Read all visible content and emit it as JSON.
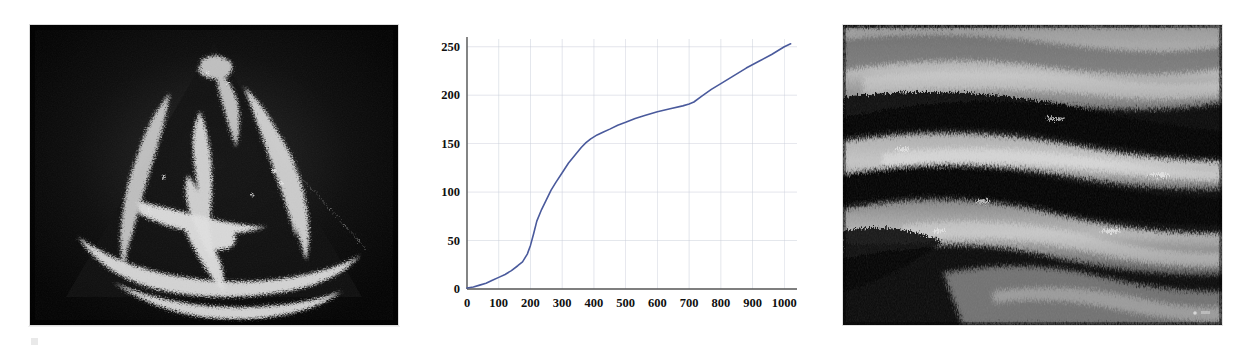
{
  "figure": {
    "background_color": "#ffffff",
    "panels": [
      {
        "id": "cardiac-echocardiogram",
        "kind": "ultrasound-image",
        "modality_label": "echocardiogram",
        "view_label": "apical four-chamber view",
        "background_color": "#050505",
        "tissue_color": "#d8d8d8"
      },
      {
        "id": "cumulative-curve-chart",
        "kind": "line-chart"
      },
      {
        "id": "vascular-ultrasound",
        "kind": "ultrasound-image",
        "modality_label": "B-mode vascular ultrasound",
        "view_label": "longitudinal vessel wall view",
        "background_color": "#0a0a0a",
        "tissue_color": "#c9c9c9"
      }
    ]
  },
  "chart_data": {
    "type": "line",
    "title": "",
    "subtitle": "",
    "xlabel": "",
    "ylabel": "",
    "xlim": [
      0,
      1040
    ],
    "ylim": [
      0,
      258
    ],
    "grid": true,
    "grid_color": "#c8ccd8",
    "axis_color": "#555555",
    "legend": false,
    "legend_position": "none",
    "line_color": "#4a5a9c",
    "line_width": 1.6,
    "xticks": [
      0,
      100,
      200,
      300,
      400,
      500,
      600,
      700,
      800,
      900,
      1000
    ],
    "xtick_labels": [
      "0",
      "100",
      "200",
      "300",
      "400",
      "500",
      "600",
      "700",
      "800",
      "900",
      "1000"
    ],
    "yticks": [
      0,
      50,
      100,
      150,
      200,
      250
    ],
    "ytick_labels": [
      "0",
      "50",
      "100",
      "150",
      "200",
      "250"
    ],
    "series": [
      {
        "name": "cumulative curve",
        "x": [
          0,
          20,
          40,
          60,
          80,
          100,
          120,
          140,
          160,
          175,
          190,
          200,
          210,
          220,
          235,
          250,
          265,
          280,
          300,
          320,
          340,
          360,
          375,
          390,
          410,
          430,
          450,
          475,
          500,
          530,
          560,
          600,
          640,
          680,
          700,
          715,
          740,
          770,
          800,
          840,
          880,
          920,
          960,
          1000,
          1020
        ],
        "y": [
          1,
          2,
          4,
          6,
          9,
          12,
          15,
          19,
          24,
          28,
          36,
          45,
          57,
          70,
          82,
          92,
          102,
          110,
          120,
          130,
          138,
          146,
          151,
          155,
          159,
          162,
          165,
          169,
          172,
          176,
          179,
          183,
          186,
          189,
          191,
          193,
          199,
          206,
          212,
          220,
          228,
          235,
          242,
          250,
          253
        ]
      }
    ]
  }
}
